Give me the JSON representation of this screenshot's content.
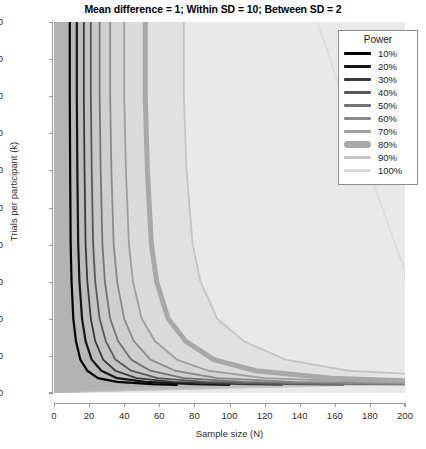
{
  "chart_data": {
    "type": "line",
    "title": "Mean difference = 1; Within SD = 10; Between SD = 2",
    "xlabel": "Sample size (N)",
    "ylabel": "Trials per participant (k)",
    "xlim": [
      0,
      200
    ],
    "ylim": [
      0,
      100
    ],
    "xticks": [
      0,
      20,
      40,
      60,
      80,
      100,
      120,
      140,
      160,
      180,
      200
    ],
    "yticks": [
      0,
      10,
      20,
      30,
      40,
      50,
      60,
      70,
      80,
      90,
      100
    ],
    "grid": false,
    "background_color": "#e9e9e9",
    "legend_position": "top-right",
    "legend_title": "Power",
    "annotation": "Iso-power contour plot: statistical power as a function of sample size (N) and trials per participant (k). Contours are hyperbolic; the 80% contour is drawn with an emphasized thick line.",
    "series": [
      {
        "name": "10%",
        "power": 10,
        "color": "#000000",
        "width": 2.2,
        "points": [
          [
            9,
            100
          ],
          [
            9,
            80
          ],
          [
            9.2,
            60
          ],
          [
            9.5,
            40
          ],
          [
            10,
            30
          ],
          [
            11,
            20
          ],
          [
            12.5,
            14
          ],
          [
            15,
            9
          ],
          [
            19,
            6
          ],
          [
            25,
            4
          ],
          [
            36,
            3
          ],
          [
            56,
            2.4
          ],
          [
            70,
            2.2
          ]
        ]
      },
      {
        "name": "20%",
        "power": 20,
        "color": "#151515",
        "width": 2.2,
        "points": [
          [
            13,
            100
          ],
          [
            13,
            80
          ],
          [
            13.3,
            60
          ],
          [
            13.8,
            40
          ],
          [
            14.5,
            30
          ],
          [
            16,
            20
          ],
          [
            18,
            14
          ],
          [
            21.5,
            9
          ],
          [
            27,
            6
          ],
          [
            36,
            4
          ],
          [
            52,
            3
          ],
          [
            80,
            2.4
          ],
          [
            100,
            2.2
          ]
        ]
      },
      {
        "name": "30%",
        "power": 30,
        "color": "#3a3a3a",
        "width": 1.8,
        "points": [
          [
            17,
            100
          ],
          [
            17,
            80
          ],
          [
            17.4,
            60
          ],
          [
            18,
            40
          ],
          [
            19,
            30
          ],
          [
            21,
            20
          ],
          [
            23.5,
            14
          ],
          [
            28,
            9
          ],
          [
            35,
            6
          ],
          [
            47,
            4
          ],
          [
            68,
            3
          ],
          [
            105,
            2.4
          ],
          [
            130,
            2.2
          ]
        ]
      },
      {
        "name": "40%",
        "power": 40,
        "color": "#585858",
        "width": 1.8,
        "points": [
          [
            21,
            100
          ],
          [
            21,
            80
          ],
          [
            21.5,
            60
          ],
          [
            22.3,
            40
          ],
          [
            23.5,
            30
          ],
          [
            26,
            20
          ],
          [
            29.5,
            14
          ],
          [
            35,
            9
          ],
          [
            44,
            6
          ],
          [
            59,
            4
          ],
          [
            86,
            3
          ],
          [
            133,
            2.4
          ],
          [
            165,
            2.2
          ]
        ]
      },
      {
        "name": "50%",
        "power": 50,
        "color": "#737373",
        "width": 1.8,
        "points": [
          [
            26,
            100
          ],
          [
            26,
            80
          ],
          [
            26.6,
            60
          ],
          [
            27.6,
            40
          ],
          [
            29,
            30
          ],
          [
            32,
            20
          ],
          [
            36.5,
            14
          ],
          [
            44,
            9
          ],
          [
            55,
            6
          ],
          [
            74,
            4
          ],
          [
            108,
            3
          ],
          [
            168,
            2.4
          ],
          [
            200,
            2.25
          ]
        ]
      },
      {
        "name": "60%",
        "power": 60,
        "color": "#8a8a8a",
        "width": 1.8,
        "points": [
          [
            32,
            100
          ],
          [
            32,
            80
          ],
          [
            32.7,
            60
          ],
          [
            34,
            40
          ],
          [
            36,
            30
          ],
          [
            40,
            20
          ],
          [
            45.5,
            14
          ],
          [
            55,
            9
          ],
          [
            69,
            6
          ],
          [
            93,
            4
          ],
          [
            137,
            3
          ],
          [
            200,
            2.5
          ]
        ]
      },
      {
        "name": "70%",
        "power": 70,
        "color": "#9e9e9e",
        "width": 1.8,
        "points": [
          [
            40,
            100
          ],
          [
            40,
            80
          ],
          [
            41,
            60
          ],
          [
            42.7,
            40
          ],
          [
            45,
            30
          ],
          [
            50,
            20
          ],
          [
            57.5,
            14
          ],
          [
            70,
            9
          ],
          [
            88,
            6
          ],
          [
            120,
            4
          ],
          [
            178,
            3
          ],
          [
            200,
            2.8
          ]
        ]
      },
      {
        "name": "80%",
        "power": 80,
        "color": "#a8a8a8",
        "width": 5.0,
        "points": [
          [
            52,
            100
          ],
          [
            52,
            80
          ],
          [
            53.2,
            60
          ],
          [
            55.5,
            40
          ],
          [
            58.5,
            30
          ],
          [
            65,
            20
          ],
          [
            75,
            14
          ],
          [
            91,
            9
          ],
          [
            115,
            6
          ],
          [
            158,
            4
          ],
          [
            200,
            3.3
          ]
        ]
      },
      {
        "name": "90%",
        "power": 90,
        "color": "#c4c4c4",
        "width": 1.8,
        "points": [
          [
            74,
            100
          ],
          [
            74,
            80
          ],
          [
            75.5,
            60
          ],
          [
            79,
            40
          ],
          [
            83.5,
            30
          ],
          [
            93,
            20
          ],
          [
            108,
            14
          ],
          [
            132,
            9
          ],
          [
            168,
            6
          ],
          [
            200,
            5.2
          ]
        ]
      },
      {
        "name": "100%",
        "power": 100,
        "color": "#dcdcdc",
        "width": 1.8,
        "points": [
          [
            150,
            100
          ],
          [
            156,
            92
          ],
          [
            160,
            86
          ],
          [
            166,
            78
          ],
          [
            172,
            70
          ],
          [
            178,
            62
          ],
          [
            184,
            54
          ],
          [
            190,
            46
          ],
          [
            196,
            38
          ],
          [
            200,
            33
          ],
          [
            200,
            30
          ]
        ]
      }
    ],
    "bands": [
      {
        "from": 0,
        "to": 10,
        "color": "#b3b3b3"
      },
      {
        "from": 10,
        "to": 20,
        "color": "#b8b8b8"
      },
      {
        "from": 20,
        "to": 30,
        "color": "#bdbdbd"
      },
      {
        "from": 30,
        "to": 40,
        "color": "#c3c3c3"
      },
      {
        "from": 40,
        "to": 50,
        "color": "#c9c9c9"
      },
      {
        "from": 50,
        "to": 60,
        "color": "#cfcfcf"
      },
      {
        "from": 60,
        "to": 70,
        "color": "#d5d5d5"
      },
      {
        "from": 70,
        "to": 80,
        "color": "#dbdbdb"
      },
      {
        "from": 80,
        "to": 90,
        "color": "#e1e1e1"
      },
      {
        "from": 90,
        "to": 100,
        "color": "#e9e9e9"
      }
    ]
  },
  "legend": {
    "title": "Power",
    "entries": [
      {
        "label": "10%",
        "color": "#000000",
        "thick": false
      },
      {
        "label": "20%",
        "color": "#151515",
        "thick": false
      },
      {
        "label": "30%",
        "color": "#3a3a3a",
        "thick": false
      },
      {
        "label": "40%",
        "color": "#585858",
        "thick": false
      },
      {
        "label": "50%",
        "color": "#737373",
        "thick": false
      },
      {
        "label": "60%",
        "color": "#8a8a8a",
        "thick": false
      },
      {
        "label": "70%",
        "color": "#9e9e9e",
        "thick": false
      },
      {
        "label": "80%",
        "color": "#a8a8a8",
        "thick": true
      },
      {
        "label": "90%",
        "color": "#c4c4c4",
        "thick": false
      },
      {
        "label": "100%",
        "color": "#dcdcdc",
        "thick": false
      }
    ]
  }
}
